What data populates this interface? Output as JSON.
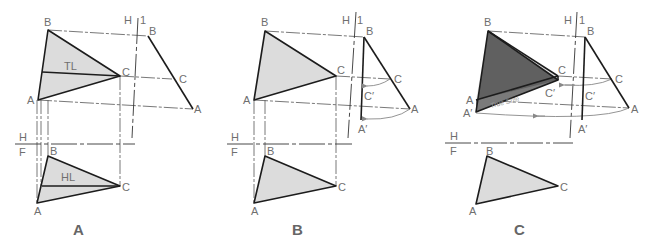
{
  "figure": {
    "colors": {
      "background": "#ffffff",
      "edge": "#1c1c1c",
      "plane_fill_light": "#dcdcdc",
      "plane_fill_true_size": "#606060",
      "label": "#6f6f6f",
      "arc": "#888888"
    },
    "panels": [
      {
        "id": "A",
        "label": "A",
        "fold_lines": {
          "h1_h": "H",
          "h1_1": "1",
          "hf_h": "H",
          "hf_f": "F"
        },
        "top_view": {
          "B": "B",
          "C": "C",
          "A": "A",
          "line": "TL"
        },
        "aux_view": {
          "B": "B",
          "C": "C",
          "A": "A"
        },
        "front_view": {
          "B": "B",
          "C": "C",
          "A": "A",
          "line": "HL"
        }
      },
      {
        "id": "B",
        "label": "B",
        "fold_lines": {
          "h1_h": "H",
          "h1_1": "1",
          "hf_h": "H",
          "hf_f": "F"
        },
        "top_view": {
          "B": "B",
          "C": "C",
          "A": "A"
        },
        "aux_view": {
          "B": "B",
          "C": "C",
          "A": "A",
          "C_rev": "C′",
          "A_rev": "A′"
        },
        "front_view": {
          "B": "B",
          "C": "C",
          "A": "A"
        }
      },
      {
        "id": "C",
        "label": "C",
        "fold_lines": {
          "h1_h": "H",
          "h1_1": "1",
          "hf_h": "H",
          "hf_f": "F"
        },
        "top_view": {
          "B": "B",
          "C": "C",
          "A": "A",
          "C_rev": "C′",
          "A_rev": "A′",
          "true_size": "True Size"
        },
        "aux_view": {
          "B": "B",
          "C": "C",
          "A": "A",
          "C_rev": "C′",
          "A_rev": "A′"
        },
        "front_view": {
          "B": "B",
          "C": "C",
          "A": "A"
        }
      }
    ]
  }
}
